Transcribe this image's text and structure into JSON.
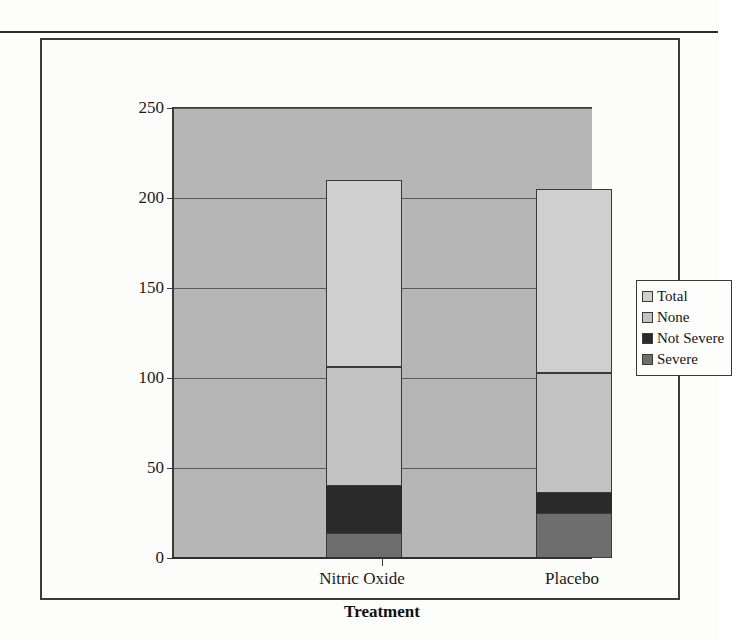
{
  "figure": {
    "frame_border_color": "#3a3a3a",
    "plot_background": "#b6b6b6"
  },
  "chart_data": {
    "type": "bar",
    "stacked": true,
    "title": "",
    "xlabel": "Treatment",
    "ylabel": "",
    "categories": [
      "Nitric Oxide",
      "Placebo"
    ],
    "ytick_labels": [
      "250",
      "200",
      "150",
      "100",
      "50",
      "0"
    ],
    "yticks": [
      250,
      200,
      150,
      100,
      50,
      0
    ],
    "ylim": [
      0,
      250
    ],
    "grid": true,
    "legend_position": "right",
    "series": [
      {
        "name": "Severe",
        "color": "#6e6e6e",
        "values": [
          14,
          25
        ]
      },
      {
        "name": "Not Severe",
        "color": "#2a2a2a",
        "values": [
          26,
          11
        ]
      },
      {
        "name": "None",
        "color": "#c2c2c2",
        "values": [
          66,
          67
        ]
      },
      {
        "name": "Total",
        "color": "#cfcfcf",
        "values": [
          104,
          102
        ]
      }
    ],
    "cumulative_tops": {
      "Nitric Oxide": {
        "Severe": 14,
        "Not Severe": 40,
        "None": 106,
        "Total": 210
      },
      "Placebo": {
        "Severe": 25,
        "Not Severe": 36,
        "None": 103,
        "Total": 205
      }
    }
  },
  "legend": {
    "items": [
      {
        "label": "Total",
        "color": "#cfcfcf"
      },
      {
        "label": "None",
        "color": "#c2c2c2"
      },
      {
        "label": "Not Severe",
        "color": "#2a2a2a"
      },
      {
        "label": "Severe",
        "color": "#6e6e6e"
      }
    ]
  }
}
